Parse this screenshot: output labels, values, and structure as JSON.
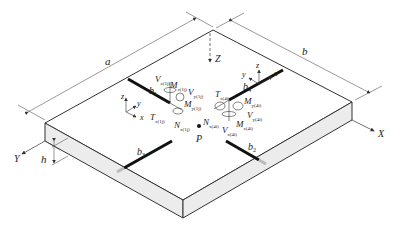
{
  "diagram": {
    "dimensions": {
      "a": "a",
      "b": "b",
      "h": "h"
    },
    "global_axes": {
      "X": "X",
      "Y": "Y",
      "Z": "Z"
    },
    "point": "P",
    "beams": [
      {
        "id": "b1",
        "label": "b",
        "sub": "1"
      },
      {
        "id": "b2",
        "label": "b",
        "sub": "2"
      },
      {
        "id": "b3",
        "label": "b",
        "sub": "3"
      },
      {
        "id": "b4",
        "label": "b",
        "sub": "4"
      }
    ],
    "local_axes_1": {
      "x": "x",
      "y": "y",
      "z": "z"
    },
    "local_axes_4": {
      "x": "x",
      "y": "y",
      "z": "z"
    },
    "forces_1": {
      "Vz": {
        "main": "V",
        "sub": "z(1j)"
      },
      "Mz": {
        "main": "M",
        "sub": "z(1j)"
      },
      "Vy": {
        "main": "V",
        "sub": "y(1j)"
      },
      "My": {
        "main": "M",
        "sub": "y(1j)"
      },
      "T": {
        "main": "T",
        "sub": "x(1j)"
      },
      "N": {
        "main": "N",
        "sub": "x(1j)"
      }
    },
    "forces_4": {
      "T": {
        "main": "T",
        "sub": "x(4i)"
      },
      "My": {
        "main": "M",
        "sub": "y(4i)"
      },
      "N": {
        "main": "N",
        "sub": "x(4i)"
      },
      "Vy": {
        "main": "V",
        "sub": "y(4i)"
      },
      "Vz": {
        "main": "V",
        "sub": "z(4i)"
      },
      "Mz": {
        "main": "M",
        "sub": "z(4i)"
      }
    },
    "colors": {
      "line": "#333333",
      "plate_side": "#ececec",
      "beam": "#111111"
    }
  }
}
